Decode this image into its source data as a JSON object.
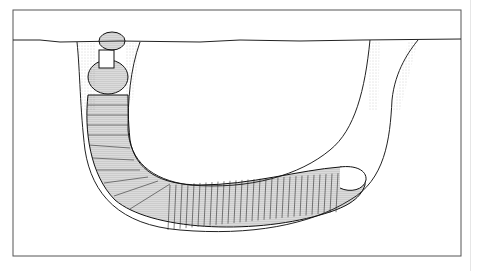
{
  "figure": {
    "colors": {
      "background": "#ffffff",
      "frame": "#555555",
      "ink": "#1a1a1a",
      "stipple": "#777777"
    }
  }
}
